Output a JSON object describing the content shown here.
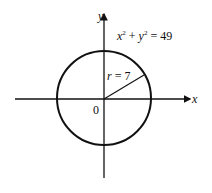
{
  "diagram": {
    "equation": {
      "x": "x",
      "xexp": "2",
      "plus": " + ",
      "y": "y",
      "yexp": "2",
      "rhs": " = 49"
    },
    "radius_label": {
      "r": "r",
      "eq": " = 7"
    },
    "origin_label": "0",
    "x_axis_label": "x",
    "y_axis_label": "y",
    "circle": {
      "center": [
        0,
        0
      ],
      "radius": 7
    },
    "colors": {
      "stroke": "#111111",
      "background": "#ffffff"
    }
  }
}
